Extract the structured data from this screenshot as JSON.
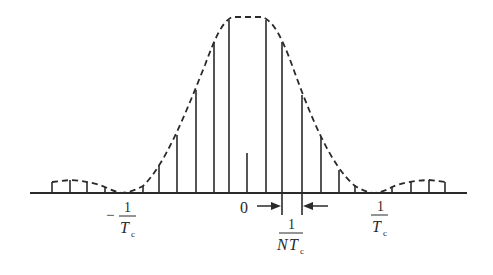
{
  "diagram": {
    "title": "",
    "type": "sampled spectrum with sinc-squared-like envelope",
    "labels": {
      "origin": "0",
      "neg_tick_sign": "−",
      "neg_tick_num": "1",
      "neg_tick_den_T": "T",
      "neg_tick_den_sub": "c",
      "pos_tick_num": "1",
      "pos_tick_den_T": "T",
      "pos_tick_den_sub": "c",
      "spacing_num": "1",
      "spacing_den_N": "N",
      "spacing_den_T": "T",
      "spacing_den_sub": "c"
    },
    "axis": {
      "x_start": 30,
      "x_end": 467,
      "y": 193
    },
    "envelope_color": "#2a2a2a",
    "stem_color": "#2a2a2a",
    "stems": [
      {
        "x": 52,
        "top": 182
      },
      {
        "x": 70,
        "top": 180
      },
      {
        "x": 87,
        "top": 182
      },
      {
        "x": 105,
        "top": 187
      },
      {
        "x": 143,
        "top": 186
      },
      {
        "x": 159,
        "top": 165
      },
      {
        "x": 177,
        "top": 135
      },
      {
        "x": 196,
        "top": 90
      },
      {
        "x": 214,
        "top": 42
      },
      {
        "x": 229,
        "top": 20
      },
      {
        "x": 247,
        "top": 153,
        "note": "short center stem"
      },
      {
        "x": 266,
        "top": 20
      },
      {
        "x": 282,
        "top": 42
      },
      {
        "x": 302,
        "top": 95
      },
      {
        "x": 321,
        "top": 137
      },
      {
        "x": 339,
        "top": 170
      },
      {
        "x": 355,
        "top": 185
      },
      {
        "x": 392,
        "top": 187
      },
      {
        "x": 411,
        "top": 182
      },
      {
        "x": 429,
        "top": 180
      },
      {
        "x": 445,
        "top": 182
      }
    ]
  }
}
